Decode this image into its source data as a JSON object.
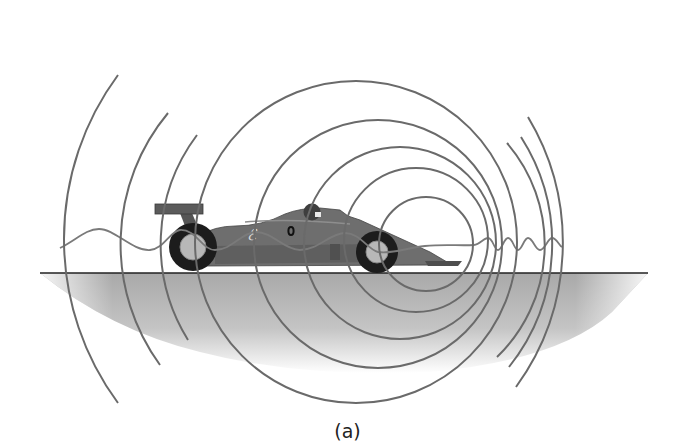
{
  "figure": {
    "caption": "(a)",
    "colors": {
      "wavefront": "#6a6a6a",
      "ground_line": "#222222",
      "ground_shadow": "#b0b0b0",
      "car_body": "#6e6e6e",
      "tire": "#1c1c1c",
      "hub": "#b8b8b8"
    },
    "car": {
      "number_label": "0",
      "logo_glyph": "ℰ"
    },
    "wavefronts": {
      "full_circle_count": 5,
      "rear_partial_arc_count": 3,
      "front_partial_arc_count": 3
    },
    "wave_trace": {
      "behind_car": "long wavelength (lower pitch)",
      "ahead_of_car": "short wavelength (higher pitch)"
    }
  }
}
